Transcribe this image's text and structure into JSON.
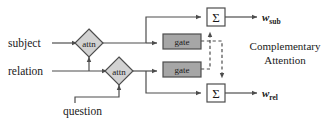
{
  "diagram": {
    "inputs": [
      {
        "id": "subject",
        "label": "subject",
        "x": 8,
        "y": 47
      },
      {
        "id": "relation",
        "label": "relation",
        "x": 8,
        "y": 75
      },
      {
        "id": "question",
        "label": "question",
        "x": 63,
        "y": 115
      }
    ],
    "attention_nodes": [
      {
        "id": "attn-subject",
        "label": "attn",
        "cx": 89,
        "cy": 43
      },
      {
        "id": "attn-relation",
        "label": "attn",
        "cx": 119,
        "cy": 71
      }
    ],
    "gates": [
      {
        "id": "gate-subject",
        "label": "gate",
        "x": 163,
        "y": 34,
        "w": 38,
        "h": 15
      },
      {
        "id": "gate-relation",
        "label": "gate",
        "x": 163,
        "y": 62,
        "w": 38,
        "h": 15
      }
    ],
    "sum_nodes": [
      {
        "id": "sum-subject",
        "label": "Σ",
        "x": 207,
        "y": 8,
        "w": 18,
        "h": 18
      },
      {
        "id": "sum-relation",
        "label": "Σ",
        "x": 207,
        "y": 84,
        "w": 18,
        "h": 18
      }
    ],
    "outputs": [
      {
        "id": "w-sub",
        "base": "w",
        "subscript": "sub",
        "x": 262,
        "y": 21
      },
      {
        "id": "w-rel",
        "base": "w",
        "subscript": "rel",
        "x": 262,
        "y": 97
      }
    ],
    "annotations": [
      {
        "id": "complementary-attention",
        "line1": "Complementary",
        "line2": "Attention",
        "x": 285,
        "y": 50
      }
    ],
    "colors": {
      "stroke": "#4d4d4d",
      "text": "#1a1a1a",
      "attn_fill": "#d2d2d2",
      "gate_fill": "#a6a6a6",
      "sum_fill": "#ffffff",
      "background": "#ffffff"
    },
    "edge_style": {
      "solid": "solid",
      "dashed": "dashed"
    }
  }
}
